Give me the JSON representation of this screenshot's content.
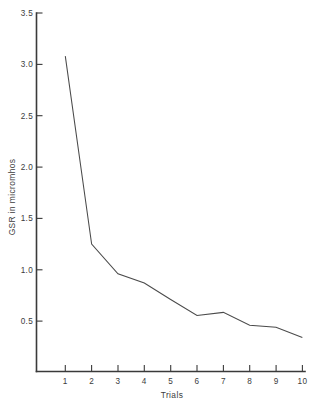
{
  "chart_data": {
    "type": "line",
    "title": "",
    "xlabel": "Trials",
    "ylabel": "GSR in micromhos",
    "x": [
      1,
      2,
      3,
      4,
      5,
      6,
      7,
      8,
      9,
      10
    ],
    "values": [
      3.08,
      1.25,
      0.96,
      0.87,
      0.71,
      0.555,
      0.585,
      0.46,
      0.44,
      0.34
    ],
    "series": [
      {
        "name": "GSR",
        "values": [
          3.08,
          1.25,
          0.96,
          0.87,
          0.71,
          0.555,
          0.585,
          0.46,
          0.44,
          0.34
        ]
      }
    ],
    "x_tick_labels": [
      "1",
      "2",
      "3",
      "4",
      "5",
      "6",
      "7",
      "8",
      "9",
      "10"
    ],
    "y_tick_labels": [
      "0.5",
      "1.0",
      "1.5",
      "2.0",
      "2.5",
      "3.0",
      "3.5"
    ],
    "y_tick_values": [
      0.5,
      1.0,
      1.5,
      2.0,
      2.5,
      3.0,
      3.5
    ],
    "xlim": [
      0.45,
      10.55
    ],
    "ylim": [
      0.013,
      3.5
    ],
    "grid": false,
    "legend": false,
    "legend_position": "none",
    "line_color": "#4a4a4a",
    "axis_color": "#3a3a3a",
    "background_color": "#ffffff"
  }
}
